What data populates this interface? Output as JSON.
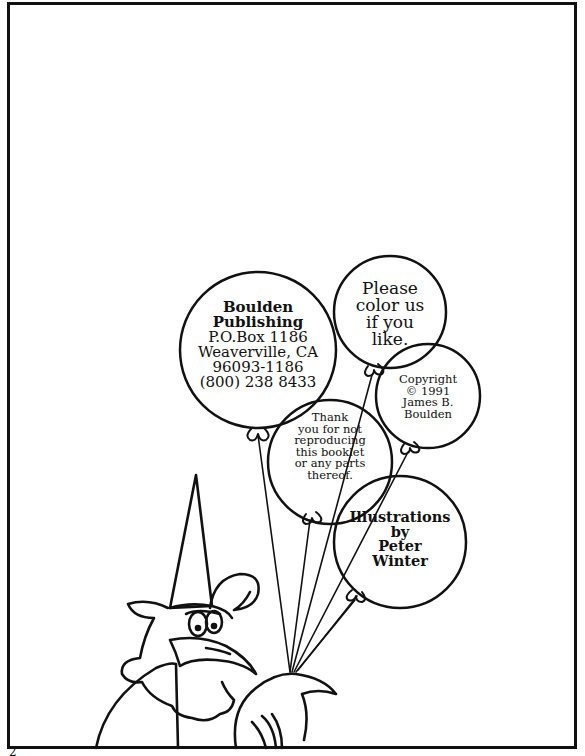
{
  "page": {
    "page_number": "2",
    "border_color": "#111111",
    "background": "#ffffff"
  },
  "balloons": {
    "publisher": {
      "lines": [
        "Boulden",
        "Publishing",
        "P.O.Box 1186",
        "Weaverville, CA",
        "96093-1186",
        "(800) 238 8433"
      ]
    },
    "color_us": {
      "lines": [
        "Please",
        "color us",
        "if you",
        "like."
      ]
    },
    "copyright": {
      "lines": [
        "Copyright",
        "© 1991",
        "James B.",
        "Boulden"
      ]
    },
    "thank_you": {
      "lines": [
        "Thank",
        "you for not",
        "reproducing",
        "this booklet",
        "or any parts",
        "thereof."
      ]
    },
    "illustrations": {
      "lines": [
        "Illustrations",
        "by",
        "Peter",
        "Winter"
      ]
    }
  },
  "illustration": {
    "subject": "cartoon bird wearing a pointed hat holding balloon strings"
  }
}
